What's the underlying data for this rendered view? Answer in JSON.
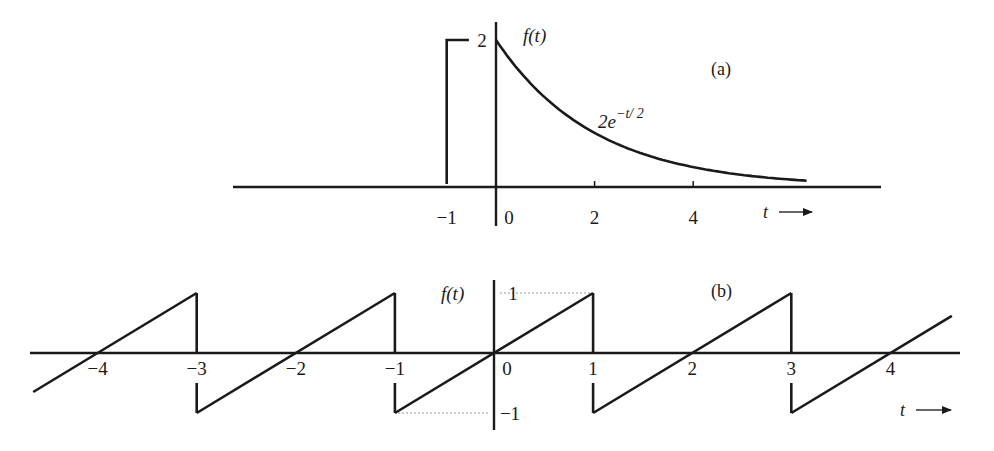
{
  "chart_data": [
    {
      "type": "line",
      "panel_label": "(a)",
      "ylabel": "f(t)",
      "xlabel": "t",
      "annotation": "2e^{-t/2}",
      "annotation_parts": {
        "coef": "2e",
        "exp": "−t/ 2"
      },
      "x_ticks": [
        {
          "value": -1,
          "label": "−1"
        },
        {
          "value": 0,
          "label": "0"
        },
        {
          "value": 2,
          "label": "2"
        },
        {
          "value": 4,
          "label": "4"
        }
      ],
      "y_ticks": [
        {
          "value": 2,
          "label": "2"
        }
      ],
      "xlim": [
        -5.4,
        7.9
      ],
      "ylim": [
        -0.5,
        2.3
      ],
      "series": [
        {
          "name": "f(t) = 2e^{-t/2}, t >= 0",
          "function": "2*exp(-t/2)",
          "domain": [
            0,
            6.3
          ],
          "x": [
            0,
            0.5,
            1,
            1.5,
            2,
            2.5,
            3,
            3.5,
            4,
            4.5,
            5,
            5.5,
            6,
            6.3
          ],
          "y": [
            2.0,
            1.558,
            1.213,
            0.945,
            0.736,
            0.573,
            0.446,
            0.348,
            0.271,
            0.211,
            0.164,
            0.128,
            0.1,
            0.086
          ]
        },
        {
          "name": "left edge at t = -1",
          "x": [
            -1,
            -1,
            -0.55
          ],
          "y": [
            0,
            2,
            2
          ]
        }
      ]
    },
    {
      "type": "line",
      "panel_label": "(b)",
      "ylabel": "f(t)",
      "xlabel": "t",
      "x_ticks": [
        {
          "value": -4,
          "label": "−4"
        },
        {
          "value": -3,
          "label": "−3"
        },
        {
          "value": -2,
          "label": "−2"
        },
        {
          "value": -1,
          "label": "−1"
        },
        {
          "value": 0,
          "label": "0"
        },
        {
          "value": 1,
          "label": "1"
        },
        {
          "value": 2,
          "label": "2"
        },
        {
          "value": 3,
          "label": "3"
        },
        {
          "value": 4,
          "label": "4"
        }
      ],
      "y_ticks": [
        {
          "value": 1,
          "label": "1"
        },
        {
          "value": -1,
          "label": "−1"
        }
      ],
      "xlim": [
        -4.68,
        4.7
      ],
      "ylim": [
        -1.3,
        1.2
      ],
      "series": [
        {
          "name": "sawtooth f(t), period 2, slope 1, jumps at odd t",
          "x": [
            -4.65,
            -3,
            -3,
            -1,
            -1,
            1,
            1,
            3,
            3,
            4.62
          ],
          "y": [
            -0.65,
            1,
            -1,
            1,
            -1,
            1,
            -1,
            1,
            -1,
            0.62
          ]
        }
      ]
    }
  ]
}
